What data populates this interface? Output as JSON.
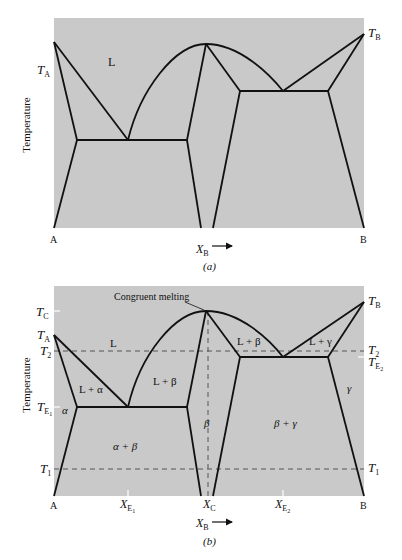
{
  "colors": {
    "background": "#ffffff",
    "field": "#c9c9c9",
    "line": "#111111",
    "dash": "#555555"
  },
  "diagram_a": {
    "caption": "(a)",
    "y_axis_label": "Temperature",
    "x_axis_label": "X",
    "x_axis_subscript": "B",
    "left_component": "A",
    "right_component": "B",
    "temp_labels": {
      "TA": {
        "main": "T",
        "sub": "A"
      },
      "TB": {
        "main": "T",
        "sub": "B"
      }
    },
    "region_labels": {
      "liquid": "L"
    }
  },
  "diagram_b": {
    "caption": "(b)",
    "y_axis_label": "Temperature",
    "x_axis_label": "X",
    "x_axis_subscript": "B",
    "left_component": "A",
    "right_component": "B",
    "annotation": "Congruent melting",
    "temp_labels_left": {
      "TC": {
        "main": "T",
        "sub": "C"
      },
      "TA": {
        "main": "T",
        "sub": "A"
      },
      "T2": {
        "main": "T",
        "sub": "2"
      },
      "TE1": {
        "main": "T",
        "sub": "E",
        "subsub": "1"
      },
      "T1": {
        "main": "T",
        "sub": "1"
      }
    },
    "temp_labels_right": {
      "TB": {
        "main": "T",
        "sub": "B"
      },
      "T2": {
        "main": "T",
        "sub": "2"
      },
      "TE2": {
        "main": "T",
        "sub": "E",
        "subsub": "2"
      },
      "T1": {
        "main": "T",
        "sub": "1"
      }
    },
    "composition_labels": {
      "XE1": {
        "main": "X",
        "sub": "E",
        "subsub": "1"
      },
      "XC": {
        "main": "X",
        "sub": "C"
      },
      "XE2": {
        "main": "X",
        "sub": "E",
        "subsub": "2"
      }
    },
    "region_labels": {
      "liquid": "L",
      "l_alpha": "L + α",
      "l_beta_left": "L + β",
      "l_beta_right": "L + β",
      "l_gamma": "L + γ",
      "alpha": "α",
      "alpha_beta": "α + β",
      "beta": "β",
      "beta_gamma": "β + γ",
      "gamma": "γ"
    }
  }
}
